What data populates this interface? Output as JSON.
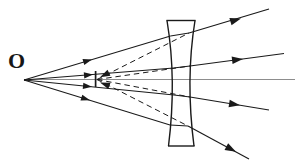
{
  "figure": {
    "kind": "optics-ray-diagram",
    "width": 295,
    "height": 161,
    "background_color": "#ffffff",
    "ink_color": "#1a1a1a",
    "axis_color": "#8d8d8d"
  },
  "labels": {
    "object_point": "O"
  },
  "geometry": {
    "object_point": {
      "x": 24,
      "y": 80
    },
    "virtual_image_tick": {
      "x": 95.5,
      "y_top": 71,
      "y_bottom": 87
    },
    "optical_axis": {
      "y": 79.5,
      "x_start": 24,
      "x_end": 295
    },
    "lens": {
      "type": "biconcave",
      "top_edge": {
        "y": 20.5,
        "x_left": 167,
        "x_right": 195
      },
      "bottom_edge": {
        "y": 146,
        "x_left": 168.5,
        "x_right": 194
      },
      "waist": {
        "y": 80,
        "x_left": 175,
        "x_right": 186.5
      },
      "left_surface_path": "M 167 20.5 Q 176.5 80 168.5 146",
      "right_surface_path": "M 195 20.5 Q 185.5 80 194 146"
    },
    "incident_rays": [
      {
        "id": "ray-1-upper-outer",
        "from": {
          "x": 24,
          "y": 80
        },
        "to": {
          "x": 170.5,
          "y": 36
        },
        "arrow_at": {
          "x": 89,
          "y": 60.5
        }
      },
      {
        "id": "ray-2-upper-inner",
        "from": {
          "x": 24,
          "y": 80
        },
        "to": {
          "x": 173.5,
          "y": 68
        },
        "arrow_at": {
          "x": 90,
          "y": 74
        }
      },
      {
        "id": "ray-3-lower-inner",
        "from": {
          "x": 24,
          "y": 80
        },
        "to": {
          "x": 174,
          "y": 95
        },
        "arrow_at": {
          "x": 89,
          "y": 87.5
        }
      },
      {
        "id": "ray-4-lower-outer",
        "from": {
          "x": 24,
          "y": 80
        },
        "to": {
          "x": 170,
          "y": 125
        },
        "arrow_at": {
          "x": 87,
          "y": 99.5
        }
      }
    ],
    "emergent_rays": [
      {
        "id": "emergent-1",
        "from": {
          "x": 189,
          "y": 33
        },
        "to": {
          "x": 268,
          "y": 10
        },
        "arrow_at": {
          "x": 237,
          "y": 19.5
        }
      },
      {
        "id": "emergent-2",
        "from": {
          "x": 190,
          "y": 66
        },
        "to": {
          "x": 283,
          "y": 54
        },
        "arrow_at": {
          "x": 240,
          "y": 59.5
        }
      },
      {
        "id": "emergent-3",
        "from": {
          "x": 190,
          "y": 97
        },
        "to": {
          "x": 268,
          "y": 110
        },
        "arrow_at": {
          "x": 236,
          "y": 104
        }
      },
      {
        "id": "emergent-4",
        "from": {
          "x": 188,
          "y": 126
        },
        "to": {
          "x": 248,
          "y": 158
        },
        "arrow_at": {
          "x": 233,
          "y": 150
        }
      }
    ],
    "virtual_dashed_rays": [
      {
        "id": "virtual-1",
        "from": {
          "x": 95.5,
          "y": 79.5
        },
        "to": {
          "x": 189,
          "y": 33
        }
      },
      {
        "id": "virtual-2",
        "from": {
          "x": 95.5,
          "y": 79.5
        },
        "to": {
          "x": 190,
          "y": 66
        }
      },
      {
        "id": "virtual-3",
        "from": {
          "x": 95.5,
          "y": 79.5
        },
        "to": {
          "x": 190,
          "y": 97
        }
      },
      {
        "id": "virtual-4",
        "from": {
          "x": 95.5,
          "y": 79.5
        },
        "to": {
          "x": 188,
          "y": 126
        }
      }
    ],
    "convergence_arrows": [
      {
        "id": "converge-arrow-upper",
        "x": 106,
        "y": 75.5,
        "rotate": 205
      },
      {
        "id": "converge-arrow-lower",
        "x": 107,
        "y": 84,
        "rotate": 158
      }
    ]
  }
}
